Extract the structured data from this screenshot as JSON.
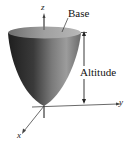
{
  "labels": {
    "base": "Base",
    "altitude": "Altitude"
  },
  "axes": {
    "x": "x",
    "y": "y",
    "z": "z"
  },
  "colors": {
    "surface_dark": "#2a2a2a",
    "surface_light": "#8a8a8a",
    "base_top": "#9a9a9a",
    "axis": "#444444"
  }
}
